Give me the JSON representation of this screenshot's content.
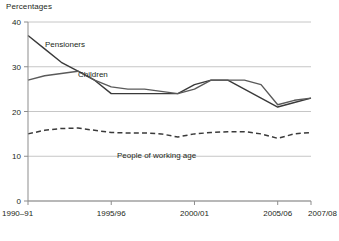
{
  "chart_data": {
    "type": "line",
    "title": "Percentages",
    "xlabel": "",
    "ylabel": "",
    "ylim": [
      0,
      40
    ],
    "yticks": [
      0,
      10,
      20,
      30,
      40
    ],
    "grid": true,
    "legend": "inline-labels",
    "x": [
      "1990-91",
      "1991/92",
      "1992/93",
      "1993/94",
      "1994/95",
      "1995/96",
      "1996/97",
      "1997/98",
      "1998/99",
      "1999/00",
      "2000/01",
      "2001/02",
      "2002/03",
      "2003/04",
      "2004/05",
      "2005/06",
      "2006/07",
      "2007/08"
    ],
    "xtick_labels": [
      "1990–91",
      "1995/96",
      "2000/01",
      "2005/06",
      "2007/08"
    ],
    "xtick_indices": [
      0,
      5,
      10,
      15,
      17
    ],
    "series": [
      {
        "name": "Pensioners",
        "style": "solid",
        "color": "#3a3a3a",
        "values": [
          37,
          34,
          31,
          29,
          27,
          24,
          24,
          24,
          24,
          24,
          26,
          27,
          27,
          25,
          23,
          21,
          22,
          23
        ]
      },
      {
        "name": "Children",
        "style": "solid",
        "color": "#5a5a5a",
        "values": [
          27,
          28,
          28.5,
          29,
          27,
          25.5,
          25,
          25,
          24.5,
          24,
          25,
          27,
          27,
          27,
          26,
          21.5,
          22.5,
          23
        ]
      },
      {
        "name": "People of working age",
        "style": "dashed",
        "color": "#3a3a3a",
        "values": [
          15,
          15.8,
          16.2,
          16.3,
          15.8,
          15.3,
          15.2,
          15.2,
          15,
          14.3,
          15,
          15.3,
          15.5,
          15.5,
          15,
          14,
          15,
          15.3
        ]
      }
    ],
    "annotations": [
      {
        "text": "Pensioners",
        "x_px": 45,
        "y_px": 47
      },
      {
        "text": "Children",
        "x_px": 78,
        "y_px": 77
      },
      {
        "text": "People of working age",
        "x_px": 117,
        "y_px": 158
      }
    ]
  }
}
